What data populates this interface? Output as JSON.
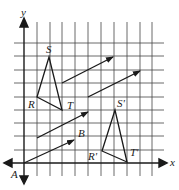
{
  "diagram": {
    "axes": {
      "x_label": "x",
      "y_label": "y"
    },
    "grid": {
      "cols": 11,
      "rows": 9,
      "origin_px": [
        24,
        163
      ],
      "cell_w": 12.8,
      "cell_h": 13.4
    },
    "triangle": {
      "vertices": [
        {
          "name": "R",
          "grid": [
            1,
            4
          ]
        },
        {
          "name": "S",
          "grid": [
            2,
            8
          ]
        },
        {
          "name": "T",
          "grid": [
            3,
            3
          ]
        }
      ]
    },
    "image_triangle": {
      "vertices": [
        {
          "name": "R'",
          "grid": [
            6,
            1
          ]
        },
        {
          "name": "S'",
          "grid": [
            7,
            5
          ]
        },
        {
          "name": "T'",
          "grid": [
            8,
            0
          ]
        }
      ]
    },
    "vectors": [
      {
        "from": [
          0,
          0
        ],
        "to": [
          4,
          2
        ]
      },
      {
        "from": [
          1,
          2
        ],
        "to": [
          5,
          4
        ]
      },
      {
        "from": [
          3,
          6
        ],
        "to": [
          7,
          8
        ]
      },
      {
        "from": [
          5,
          5
        ],
        "to": [
          9,
          7
        ]
      }
    ],
    "point_labels": [
      {
        "text": "A"
      },
      {
        "text": "B"
      }
    ],
    "colors": {
      "line": "#1a1a1a",
      "grid": "#333333",
      "background": "#ffffff"
    }
  }
}
